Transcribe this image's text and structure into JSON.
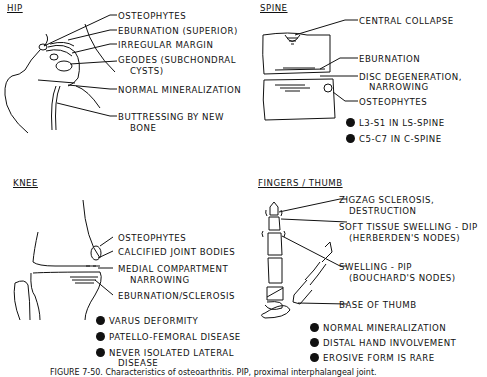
{
  "figure": {
    "caption": "FIGURE 7-50. Characteristics of osteoarthritis. PIP, proximal interphalangeal joint."
  },
  "panels": {
    "hip": {
      "title": "HIP",
      "labels": [
        "OSTEOPHYTES",
        "EBURNATION (SUPERIOR)",
        "IRREGULAR MARGIN",
        "GEODES (SUBCHONDRAL",
        "CYSTS)",
        "NORMAL MINERALIZATION",
        "BUTTRESSING BY NEW",
        "BONE"
      ]
    },
    "spine": {
      "title": "SPINE",
      "labels": [
        "CENTRAL COLLAPSE",
        "EBURNATION",
        "DISC DEGENERATION,",
        "NARROWING",
        "OSTEOPHYTES"
      ],
      "bullets": [
        "L3-S1 IN LS-SPINE",
        "C5-C7 IN C-SPINE"
      ]
    },
    "knee": {
      "title": "KNEE",
      "labels": [
        "OSTEOPHYTES",
        "CALCIFIED JOINT BODIES",
        "MEDIAL COMPARTMENT",
        "NARROWING",
        "EBURNATION/SCLEROSIS"
      ],
      "bullets": [
        "VARUS DEFORMITY",
        "PATELLO-FEMORAL DISEASE",
        "NEVER ISOLATED LATERAL",
        "DISEASE"
      ]
    },
    "fingers": {
      "title": "FINGERS / THUMB",
      "labels": [
        "ZIGZAG SCLEROSIS,",
        "DESTRUCTION",
        "SOFT TISSUE SWELLING - DIP",
        "(HERBERDEN'S NODES)",
        "SWELLING - PIP",
        "(BOUCHARD'S NODES)",
        "BASE OF THUMB"
      ],
      "bullets": [
        "NORMAL MINERALIZATION",
        "DISTAL HAND INVOLVEMENT",
        "EROSIVE FORM IS RARE"
      ]
    }
  }
}
